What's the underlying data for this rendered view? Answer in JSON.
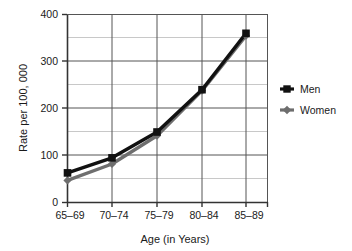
{
  "chart_data": {
    "type": "line",
    "title": "",
    "xlabel": "Age (in Years)",
    "ylabel": "Rate per 100, 000",
    "categories": [
      "65–69",
      "70–74",
      "75–79",
      "80–84",
      "85–89"
    ],
    "series": [
      {
        "name": "Men",
        "values": [
          63,
          95,
          150,
          240,
          360
        ],
        "color": "#111111",
        "marker": "square"
      },
      {
        "name": "Women",
        "values": [
          47,
          82,
          142,
          238,
          355
        ],
        "color": "#6e6e6e",
        "marker": "diamond"
      }
    ],
    "ylim": [
      0,
      400
    ],
    "ytick_labels": [
      "0",
      "100",
      "200",
      "300",
      "400"
    ],
    "ytick_values": [
      0,
      100,
      200,
      300,
      400
    ],
    "yminor_values": [
      50,
      150,
      250,
      350
    ],
    "grid": true,
    "grid_major_color": "#555555",
    "grid_minor_color": "#c8c8c8",
    "axis_color": "#333333",
    "legend_position": "right",
    "legend": [
      {
        "label": "Men",
        "color": "#111111",
        "marker": "square"
      },
      {
        "label": "Women",
        "color": "#6e6e6e",
        "marker": "diamond"
      }
    ]
  },
  "ytick_0": "0",
  "ytick_100": "100",
  "ytick_200": "200",
  "ytick_300": "300",
  "ytick_400": "400",
  "xtick_0": "65–69",
  "xtick_1": "70–74",
  "xtick_2": "75–79",
  "xtick_3": "80–84",
  "xtick_4": "85–89",
  "axis_title_x": "Age (in Years)",
  "axis_title_y": "Rate per 100, 000",
  "legend_men": "Men",
  "legend_women": "Women"
}
